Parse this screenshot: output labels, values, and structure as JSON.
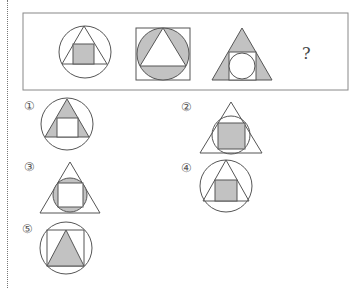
{
  "question": {
    "prompt_fragment": "",
    "sequence_figures": [
      {
        "id": "seq-1",
        "description": "circle with inscribed triangle; shaded square inside triangle"
      },
      {
        "id": "seq-2",
        "description": "square with inscribed shaded circle; white triangle inside circle"
      },
      {
        "id": "seq-3",
        "description": "shaded triangle with white inscribed square containing white circle"
      }
    ],
    "missing_marker": "?"
  },
  "options": [
    {
      "label": "①",
      "description": "circle, triangle with shaded corners, white square"
    },
    {
      "label": "②",
      "description": "triangle, circle, shaded square"
    },
    {
      "label": "③",
      "description": "triangle, shaded circle, white square"
    },
    {
      "label": "④",
      "description": "circle, triangle, shaded square"
    },
    {
      "label": "⑤",
      "description": "circle, square, shaded triangle"
    }
  ],
  "colors": {
    "shade": "#c2c2c2",
    "line": "#555555",
    "box": "#888888"
  }
}
